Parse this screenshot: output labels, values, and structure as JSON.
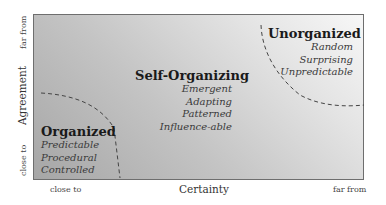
{
  "diagram": {
    "type": "stacey-matrix",
    "x_axis": {
      "title": "Certainty",
      "low": "close to",
      "high": "far from"
    },
    "y_axis": {
      "title": "Agreement",
      "low": "close to",
      "high": "far from"
    },
    "zones": [
      {
        "title": "Organized",
        "items": [
          "Predictable",
          "Procedural",
          "Controlled"
        ]
      },
      {
        "title": "Self-Organizing",
        "items": [
          "Emergent",
          "Adapting",
          "Patterned",
          "Influence-able"
        ]
      },
      {
        "title": "Unorganized",
        "items": [
          "Random",
          "Surprising",
          "Unpredictable"
        ]
      }
    ],
    "colors": {
      "gradient_dark": "#a6a6a6",
      "gradient_light": "#f7f7f7",
      "border": "#6e6e6e",
      "dash": "#444444"
    }
  }
}
